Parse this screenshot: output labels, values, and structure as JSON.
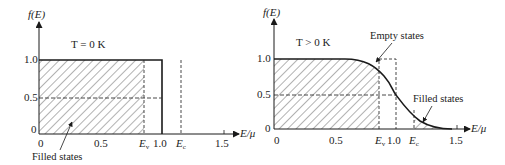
{
  "left_plot": {
    "y_label": "f(E)",
    "x_label": "E/μ",
    "condition": "T = 0 K",
    "y_ticks": [
      "1.0",
      "0.5",
      "0"
    ],
    "x_ticks": [
      "0",
      "0.5",
      "1.0",
      "1.5"
    ],
    "markers": {
      "ev": "E",
      "ev_sub": "v",
      "ec": "E",
      "ec_sub": "c"
    },
    "annotation": "Filled states"
  },
  "right_plot": {
    "y_label": "f(E)",
    "x_label": "E/μ",
    "condition": "T > 0 K",
    "y_ticks": [
      "1.0",
      "0.5",
      "0"
    ],
    "x_ticks": [
      "0",
      "0.5",
      "1.0",
      "1.5"
    ],
    "markers": {
      "ev": "E",
      "ev_sub": "v",
      "ec": "E",
      "ec_sub": "c"
    },
    "annotation_empty": "Empty states",
    "annotation_filled": "Filled states"
  },
  "colors": {
    "line": "#1a1a1a",
    "hatch": "#555555"
  }
}
